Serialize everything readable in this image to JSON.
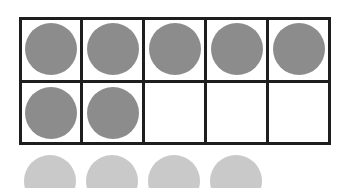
{
  "ten_frame": {
    "rows": 2,
    "cols": 5,
    "filled_count": 7,
    "cells": [
      [
        true,
        true,
        true,
        true,
        true
      ],
      [
        true,
        true,
        false,
        false,
        false
      ]
    ]
  },
  "extra_counters": {
    "count": 4
  },
  "colors": {
    "grid_line": "#1e1e1e",
    "filled_counter": "#8c8c8c",
    "extra_counter": "#c9c9c9",
    "background": "#ffffff"
  }
}
